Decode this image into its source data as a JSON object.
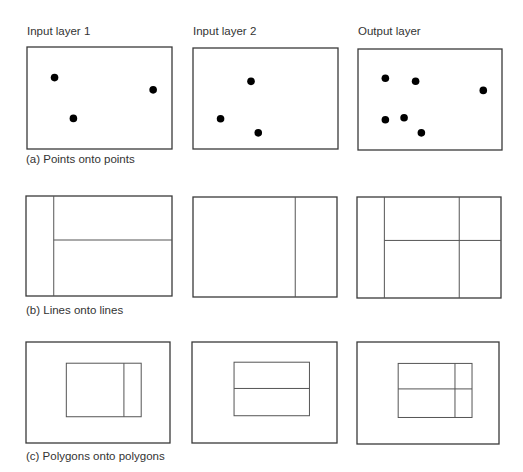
{
  "columns": [
    "Input layer 1",
    "Input layer 2",
    "Output layer"
  ],
  "rows": [
    {
      "caption": "(a) Points onto points",
      "type": "points",
      "panels": [
        {
          "name": "input-layer-1",
          "points": [
            [
              0.19,
              0.3
            ],
            [
              0.87,
              0.42
            ],
            [
              0.32,
              0.7
            ]
          ]
        },
        {
          "name": "input-layer-2",
          "points": [
            [
              0.4,
              0.33
            ],
            [
              0.19,
              0.7
            ],
            [
              0.45,
              0.84
            ]
          ]
        },
        {
          "name": "output-layer",
          "points": [
            [
              0.19,
              0.29
            ],
            [
              0.4,
              0.32
            ],
            [
              0.87,
              0.41
            ],
            [
              0.19,
              0.7
            ],
            [
              0.32,
              0.68
            ],
            [
              0.44,
              0.83
            ]
          ]
        }
      ]
    },
    {
      "caption": "(b) Lines onto lines",
      "type": "lines",
      "panels": [
        {
          "name": "input-layer-1",
          "lines": [
            [
              0.19,
              0,
              0.19,
              1
            ],
            [
              0.19,
              0.44,
              1,
              0.44
            ]
          ]
        },
        {
          "name": "input-layer-2",
          "lines": [
            [
              0.71,
              0,
              0.71,
              1
            ]
          ]
        },
        {
          "name": "output-layer",
          "lines": [
            [
              0.19,
              0,
              0.19,
              1
            ],
            [
              0.71,
              0,
              0.71,
              1
            ],
            [
              0.19,
              0.43,
              1,
              0.43
            ]
          ]
        }
      ]
    },
    {
      "caption": "(c) Polygons onto polygons",
      "type": "polygons",
      "panels": [
        {
          "name": "input-layer-1",
          "inner": [
            0.28,
            0.21,
            0.8,
            0.74
          ],
          "lines": [
            [
              0.68,
              0.21,
              0.68,
              0.74
            ]
          ]
        },
        {
          "name": "input-layer-2",
          "inner": [
            0.29,
            0.2,
            0.81,
            0.73
          ],
          "lines": [
            [
              0.29,
              0.46,
              0.81,
              0.46
            ]
          ]
        },
        {
          "name": "output-layer",
          "inner": [
            0.29,
            0.21,
            0.81,
            0.74
          ],
          "lines": [
            [
              0.69,
              0.21,
              0.69,
              0.74
            ],
            [
              0.29,
              0.46,
              0.81,
              0.46
            ]
          ]
        }
      ]
    }
  ]
}
